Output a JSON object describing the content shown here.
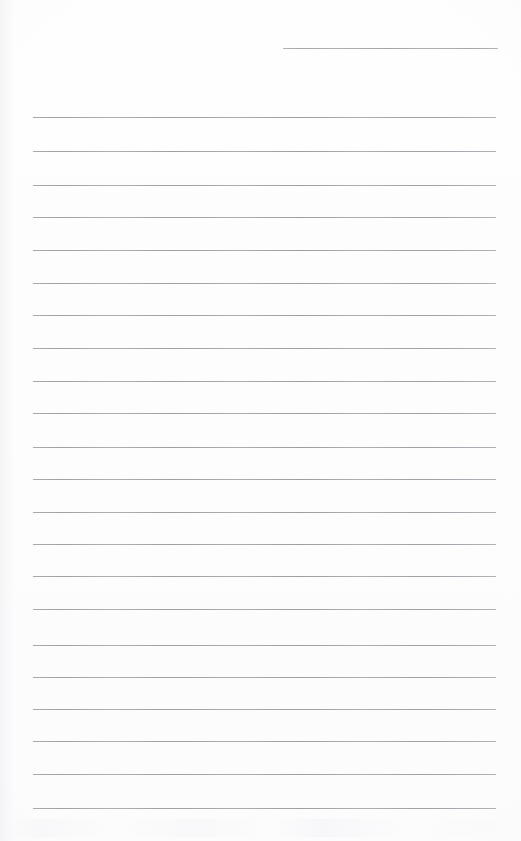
{
  "document": {
    "kind": "scanned-blank-lined-page",
    "page_background_color": "#fdfdfd",
    "rule_color": "#a9a9af",
    "page_width": 521,
    "page_height": 841,
    "text_content": "",
    "has_handwriting": false,
    "has_printed_text": false,
    "margin_line": false
  },
  "rules": {
    "count": 23,
    "full_width_left_x": 33,
    "full_width_right_x": 496,
    "spacing": 32.3,
    "items": [
      {
        "id": "rule-01",
        "x": 283,
        "y": 48,
        "width": 215,
        "partial": true
      },
      {
        "id": "rule-02",
        "x": 33,
        "y": 117,
        "width": 463,
        "partial": false
      },
      {
        "id": "rule-03",
        "x": 33,
        "y": 151,
        "width": 463,
        "partial": false
      },
      {
        "id": "rule-04",
        "x": 33,
        "y": 185,
        "width": 463,
        "partial": false
      },
      {
        "id": "rule-05",
        "x": 33,
        "y": 217,
        "width": 463,
        "partial": false
      },
      {
        "id": "rule-06",
        "x": 33,
        "y": 250,
        "width": 463,
        "partial": false
      },
      {
        "id": "rule-07",
        "x": 33,
        "y": 283,
        "width": 463,
        "partial": false
      },
      {
        "id": "rule-08",
        "x": 33,
        "y": 315,
        "width": 463,
        "partial": false
      },
      {
        "id": "rule-09",
        "x": 33,
        "y": 348,
        "width": 463,
        "partial": false
      },
      {
        "id": "rule-10",
        "x": 33,
        "y": 381,
        "width": 463,
        "partial": false
      },
      {
        "id": "rule-11",
        "x": 33,
        "y": 413,
        "width": 463,
        "partial": false
      },
      {
        "id": "rule-12",
        "x": 33,
        "y": 447,
        "width": 463,
        "partial": false
      },
      {
        "id": "rule-13",
        "x": 33,
        "y": 479,
        "width": 463,
        "partial": false
      },
      {
        "id": "rule-14",
        "x": 33,
        "y": 512,
        "width": 463,
        "partial": false
      },
      {
        "id": "rule-15",
        "x": 33,
        "y": 544,
        "width": 463,
        "partial": false
      },
      {
        "id": "rule-16",
        "x": 33,
        "y": 576,
        "width": 463,
        "partial": false
      },
      {
        "id": "rule-17",
        "x": 33,
        "y": 609,
        "width": 463,
        "partial": false
      },
      {
        "id": "rule-18",
        "x": 33,
        "y": 645,
        "width": 463,
        "partial": false
      },
      {
        "id": "rule-19",
        "x": 33,
        "y": 677,
        "width": 463,
        "partial": false
      },
      {
        "id": "rule-20",
        "x": 33,
        "y": 709,
        "width": 463,
        "partial": false
      },
      {
        "id": "rule-21",
        "x": 33,
        "y": 741,
        "width": 463,
        "partial": false
      },
      {
        "id": "rule-22",
        "x": 33,
        "y": 774,
        "width": 463,
        "partial": false
      },
      {
        "id": "rule-23",
        "x": 33,
        "y": 808,
        "width": 463,
        "partial": false
      }
    ]
  }
}
